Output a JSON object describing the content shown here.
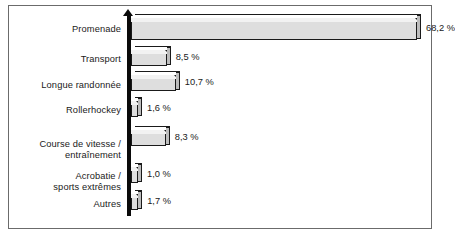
{
  "chart_data": {
    "type": "bar",
    "orientation": "horizontal",
    "title": "",
    "subtitle": "",
    "xlabel": "",
    "ylabel": "",
    "grid": false,
    "legend": null,
    "value_suffix": " %",
    "decimal_separator": ",",
    "xlim": [
      0,
      68.2
    ],
    "categories": [
      "Promenade",
      "Transport",
      "Longue randonnée",
      "Rollerhockey",
      "Course de vitesse /\nentraînement",
      "Acrobatie /\nsports extrêmes",
      "Autres"
    ],
    "values": [
      68.2,
      8.5,
      10.7,
      1.6,
      8.3,
      1.0,
      1.7
    ],
    "value_labels": [
      "68,2 %",
      "8,5 %",
      "10,7 %",
      "1,6 %",
      "8,3 %",
      "1,0 %",
      "1,7 %"
    ],
    "bars": [
      {
        "label": "Promenade",
        "value": 68.2,
        "value_label": "68,2 %"
      },
      {
        "label": "Transport",
        "value": 8.5,
        "value_label": "8,5 %"
      },
      {
        "label": "Longue randonnée",
        "value": 10.7,
        "value_label": "10,7 %"
      },
      {
        "label": "Rollerhockey",
        "value": 1.6,
        "value_label": "1,6 %"
      },
      {
        "label": "Course de vitesse /\nentraînement",
        "value": 8.3,
        "value_label": "8,3 %"
      },
      {
        "label": "Acrobatie /\nsports extrêmes",
        "value": 1.0,
        "value_label": "1,0 %"
      },
      {
        "label": "Autres",
        "value": 1.7,
        "value_label": "1,7 %"
      }
    ]
  },
  "style": {
    "bar_face": "#dedede",
    "bar_top": "#f2f2f2",
    "bar_side": "#bdbdbd",
    "outline": "#1a1a1a",
    "axis": "#0a0a0a",
    "frame_border": "#6b6b6b",
    "background": "#ffffff",
    "text": "#1a1a1a"
  }
}
